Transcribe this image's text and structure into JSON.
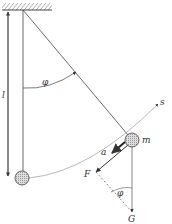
{
  "labels": {
    "length": "l",
    "angle_top": "φ",
    "angle_bottom": "φ",
    "mass": "m",
    "arc": "s",
    "acceleration": "a",
    "force": "F",
    "gravity": "G"
  },
  "colors": {
    "line": "#444444",
    "bob_fill": "#cccccc",
    "background": "#ffffff"
  }
}
